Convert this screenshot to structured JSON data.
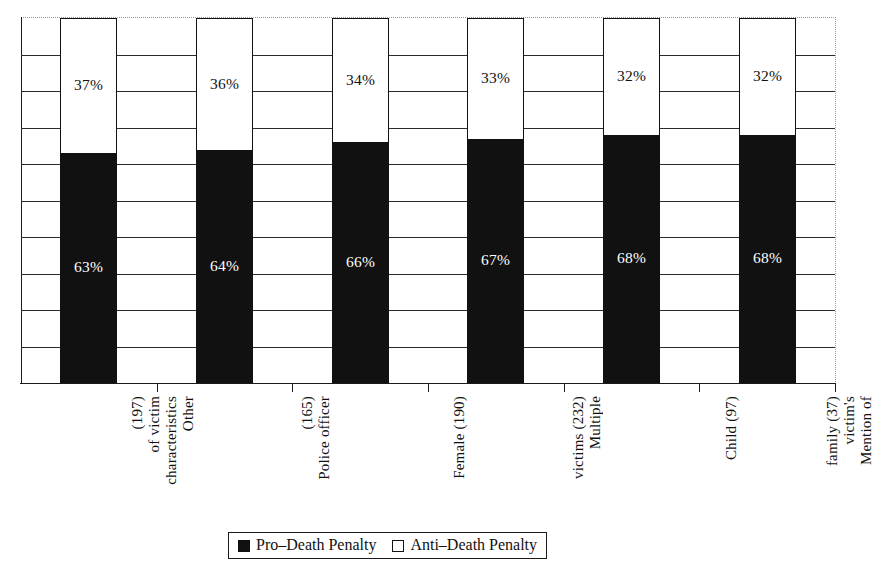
{
  "chart_data": {
    "type": "bar",
    "subtype": "stacked-percentage",
    "title": "",
    "subtitle": "",
    "xlabel": "",
    "ylabel": "",
    "ylim": [
      0,
      100
    ],
    "y_tick_interval": 10,
    "grid": true,
    "y_axis_tick_labels_visible": false,
    "legend_position": "bottom-center",
    "orientation": "vertical",
    "category_label_rotation": 90,
    "categories": [
      "Other characteristics of victim (197)",
      "Police officer (165)",
      "Female (190)",
      "Multiple victims (232)",
      "Child (97)",
      "Mention of victim's family (37)"
    ],
    "category_lines": [
      [
        "Other",
        "characteristics",
        "of victim",
        "(197)"
      ],
      [
        "Police officer",
        "(165)"
      ],
      [
        "Female (190)"
      ],
      [
        "Multiple",
        "victims (232)"
      ],
      [
        "Child (97)"
      ],
      [
        "Mention of",
        "victim's",
        "family (37)"
      ]
    ],
    "category_counts": [
      197,
      165,
      190,
      232,
      97,
      37
    ],
    "series": [
      {
        "name": "Pro–Death Penalty",
        "color": "#111111",
        "label_color": "#ffffff",
        "values": [
          63,
          64,
          66,
          67,
          68,
          68
        ],
        "value_labels": [
          "63%",
          "64%",
          "66%",
          "67%",
          "68%",
          "68%"
        ]
      },
      {
        "name": "Anti–Death Penalty",
        "color": "#ffffff",
        "label_color": "#111111",
        "values": [
          37,
          36,
          34,
          33,
          32,
          32
        ],
        "value_labels": [
          "37%",
          "36%",
          "34%",
          "33%",
          "32%",
          "32%"
        ]
      }
    ]
  },
  "legend": {
    "entries": [
      {
        "label": "Pro–Death Penalty",
        "swatch": "filled-square-icon"
      },
      {
        "label": "Anti–Death Penalty",
        "swatch": "empty-square-icon"
      }
    ]
  }
}
